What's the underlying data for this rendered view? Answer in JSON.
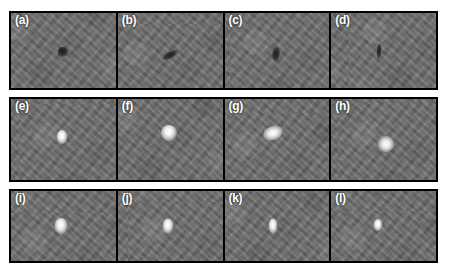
{
  "figure": {
    "background_color": "#ffffff",
    "panel_background_color": "#6e6e6e",
    "panel_border_color": "#000000",
    "label_color": "#ffffff",
    "columns": 4,
    "rows": 3,
    "panel_count": 12
  },
  "panels": [
    {
      "label": "(a)",
      "row": 1,
      "column": 1,
      "feature_type": "dark-dot",
      "feature_description": "small round dark spot near center",
      "feature_x_pct": 50,
      "feature_y_pct": 52,
      "feature_w": 11,
      "feature_h": 10,
      "feature_rotation": 0
    },
    {
      "label": "(b)",
      "row": 1,
      "column": 2,
      "feature_type": "dark-streak",
      "feature_description": "elongated diagonal dark streak",
      "feature_x_pct": 50,
      "feature_y_pct": 56,
      "feature_w": 17,
      "feature_h": 7,
      "feature_rotation": -28
    },
    {
      "label": "(c)",
      "row": 1,
      "column": 3,
      "feature_type": "dark-streak",
      "feature_description": "vertical dark streak",
      "feature_x_pct": 49,
      "feature_y_pct": 55,
      "feature_w": 8,
      "feature_h": 15,
      "feature_rotation": 8
    },
    {
      "label": "(d)",
      "row": 1,
      "column": 4,
      "feature_type": "dark-streak",
      "feature_description": "thin vertical dark mark",
      "feature_x_pct": 46,
      "feature_y_pct": 50,
      "feature_w": 5,
      "feature_h": 15,
      "feature_rotation": 4
    },
    {
      "label": "(e)",
      "row": 2,
      "column": 1,
      "feature_type": "bright-dot",
      "feature_description": "small bright blob with glow",
      "feature_x_pct": 49,
      "feature_y_pct": 47,
      "feature_w": 11,
      "feature_h": 14,
      "feature_rotation": 0
    },
    {
      "label": "(f)",
      "row": 2,
      "column": 2,
      "feature_type": "bright-dot",
      "feature_description": "larger round bright blob",
      "feature_x_pct": 49,
      "feature_y_pct": 42,
      "feature_w": 16,
      "feature_h": 16,
      "feature_rotation": 0
    },
    {
      "label": "(g)",
      "row": 2,
      "column": 3,
      "feature_type": "bright-irregular",
      "feature_description": "irregular elongated bright structure",
      "feature_x_pct": 46,
      "feature_y_pct": 42,
      "feature_w": 20,
      "feature_h": 14,
      "feature_rotation": -18
    },
    {
      "label": "(h)",
      "row": 2,
      "column": 4,
      "feature_type": "bright-irregular",
      "feature_description": "angular bright structure",
      "feature_x_pct": 52,
      "feature_y_pct": 56,
      "feature_w": 16,
      "feature_h": 16,
      "feature_rotation": 25
    },
    {
      "label": "(i)",
      "row": 3,
      "column": 1,
      "feature_type": "bright-dot",
      "feature_description": "rounded bright blob",
      "feature_x_pct": 48,
      "feature_y_pct": 50,
      "feature_w": 13,
      "feature_h": 16,
      "feature_rotation": 0
    },
    {
      "label": "(j)",
      "row": 3,
      "column": 2,
      "feature_type": "bright-dot",
      "feature_description": "rounded bright blob",
      "feature_x_pct": 48,
      "feature_y_pct": 50,
      "feature_w": 11,
      "feature_h": 15,
      "feature_rotation": 0
    },
    {
      "label": "(k)",
      "row": 3,
      "column": 3,
      "feature_type": "bright-dot",
      "feature_description": "compact bright blob",
      "feature_x_pct": 46,
      "feature_y_pct": 50,
      "feature_w": 9,
      "feature_h": 15,
      "feature_rotation": 0
    },
    {
      "label": "(l)",
      "row": 3,
      "column": 4,
      "feature_type": "bright-dot",
      "feature_description": "compact bright blob",
      "feature_x_pct": 45,
      "feature_y_pct": 48,
      "feature_w": 9,
      "feature_h": 12,
      "feature_rotation": 0
    }
  ],
  "layout": {
    "rows": [
      {
        "top": 11,
        "left": 9,
        "width": 429,
        "height": 79
      },
      {
        "top": 97,
        "left": 9,
        "width": 429,
        "height": 85
      },
      {
        "top": 189,
        "left": 9,
        "width": 429,
        "height": 74
      }
    ],
    "panel_width": 105
  }
}
